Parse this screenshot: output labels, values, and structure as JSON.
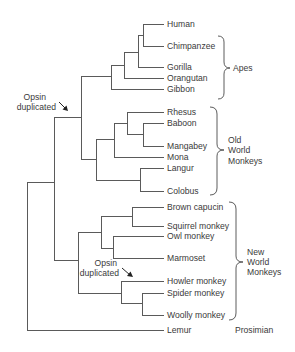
{
  "diagram": {
    "type": "phylogenetic-tree",
    "leaves": [
      {
        "label": "Human",
        "y": 24
      },
      {
        "label": "Chimpanzee",
        "y": 46
      },
      {
        "label": "Gorilla",
        "y": 67
      },
      {
        "label": "Orangutan",
        "y": 78
      },
      {
        "label": "Gibbon",
        "y": 89
      },
      {
        "label": "Rhesus",
        "y": 112
      },
      {
        "label": "Baboon",
        "y": 123
      },
      {
        "label": "Mangabey",
        "y": 146
      },
      {
        "label": "Mona",
        "y": 157
      },
      {
        "label": "Langur",
        "y": 168
      },
      {
        "label": "Colobus",
        "y": 191
      },
      {
        "label": "Brown capucin",
        "y": 207
      },
      {
        "label": "Squirrel monkey",
        "y": 226
      },
      {
        "label": "Owl monkey",
        "y": 236
      },
      {
        "label": "Marmoset",
        "y": 258
      },
      {
        "label": "Howler monkey",
        "y": 281
      },
      {
        "label": "Spider monkey",
        "y": 293
      },
      {
        "label": "Woolly monkey",
        "y": 315
      },
      {
        "label": "Lemur",
        "y": 330
      }
    ],
    "groups": [
      {
        "name": "apes",
        "lines": [
          "Apes"
        ]
      },
      {
        "name": "old-world-monkeys",
        "lines": [
          "Old",
          "World",
          "Monkeys"
        ]
      },
      {
        "name": "new-world-monkeys",
        "lines": [
          "New",
          "World",
          "Monkeys"
        ]
      },
      {
        "name": "prosimian",
        "lines": [
          "Prosimian"
        ]
      }
    ],
    "annotations": [
      {
        "name": "opsin-duplicated-anthropoid",
        "line1": "Opsin",
        "line2": "duplicated"
      },
      {
        "name": "opsin-duplicated-howler",
        "line1": "Opsin",
        "line2": "duplicated"
      }
    ]
  }
}
